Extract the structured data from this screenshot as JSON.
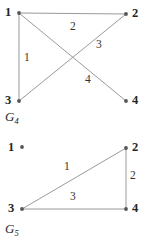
{
  "figure": {
    "background_color": "#ffffff",
    "line_color": "#9a9a9a",
    "node_color": "#555555",
    "text_color": "#262626"
  },
  "graphs": [
    {
      "caption_name": "G",
      "caption_sub": "4",
      "vertices": [
        {
          "label": "1",
          "x": 19,
          "y": 13,
          "label_side": "left"
        },
        {
          "label": "2",
          "x": 126,
          "y": 14,
          "label_side": "right"
        },
        {
          "label": "3",
          "x": 19,
          "y": 101,
          "label_side": "left"
        },
        {
          "label": "4",
          "x": 126,
          "y": 101,
          "label_side": "right"
        }
      ],
      "edges": [
        {
          "from": "1",
          "to": "2",
          "label": "2",
          "label_x": 73,
          "label_y": 27
        },
        {
          "from": "1",
          "to": "3",
          "label": "1",
          "label_x": 27,
          "label_y": 58
        },
        {
          "from": "1",
          "to": "4",
          "label": "4",
          "label_x": 88,
          "label_y": 80
        },
        {
          "from": "3",
          "to": "2",
          "label": "3",
          "label_x": 99,
          "label_y": 45
        }
      ]
    },
    {
      "caption_name": "G",
      "caption_sub": "5",
      "vertices": [
        {
          "label": "1",
          "x": 22,
          "y": 147,
          "label_side": "left"
        },
        {
          "label": "2",
          "x": 126,
          "y": 148,
          "label_side": "right"
        },
        {
          "label": "3",
          "x": 22,
          "y": 209,
          "label_side": "left"
        },
        {
          "label": "4",
          "x": 126,
          "y": 209,
          "label_side": "right"
        }
      ],
      "edges": [
        {
          "from": "3",
          "to": "2",
          "label": "1",
          "label_x": 67,
          "label_y": 167
        },
        {
          "from": "2",
          "to": "4",
          "label": "2",
          "label_x": 132,
          "label_y": 176
        },
        {
          "from": "3",
          "to": "4",
          "label": "3",
          "label_x": 73,
          "label_y": 197
        }
      ]
    }
  ],
  "labels": {
    "g4_vertex_1": "1",
    "g4_vertex_2": "2",
    "g4_vertex_3": "3",
    "g4_vertex_4": "4",
    "g4_edge_12": "2",
    "g4_edge_13": "1",
    "g4_edge_14": "4",
    "g4_edge_32": "3",
    "g4_caption": "G",
    "g4_caption_sub": "4",
    "g5_vertex_1": "1",
    "g5_vertex_2": "2",
    "g5_vertex_3": "3",
    "g5_vertex_4": "4",
    "g5_edge_32": "1",
    "g5_edge_24": "2",
    "g5_edge_34": "3",
    "g5_caption": "G",
    "g5_caption_sub": "5"
  }
}
